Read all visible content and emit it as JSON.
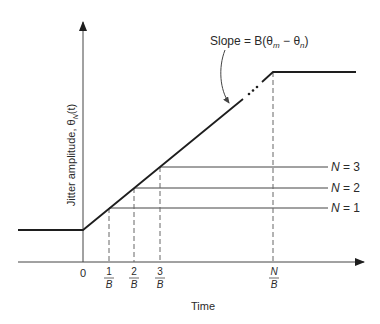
{
  "figure": {
    "y_axis_label": "Jitter amplitude, θ",
    "y_axis_label_sub": "N",
    "y_axis_label_tail": "(t)",
    "x_axis_label": "Time",
    "slope_annotation": "Slope = B(θ",
    "slope_sub_m": "m",
    "slope_minus": " − θ",
    "slope_sub_n": "n",
    "slope_close": ")",
    "ellipsis": "...",
    "x_ticks": [
      {
        "label": "0",
        "numerator": "",
        "denominator": ""
      },
      {
        "label": "1/B",
        "numerator": "1",
        "denominator": "B"
      },
      {
        "label": "2/B",
        "numerator": "2",
        "denominator": "B"
      },
      {
        "label": "3/B",
        "numerator": "3",
        "denominator": "B"
      },
      {
        "label": "N/B",
        "numerator": "N",
        "denominator": "B"
      }
    ],
    "levels": [
      {
        "label": "N = 1",
        "var": "N",
        "eq": " = 1"
      },
      {
        "label": "N = 2",
        "var": "N",
        "eq": " = 2"
      },
      {
        "label": "N = 3",
        "var": "N",
        "eq": " = 3"
      }
    ],
    "colors": {
      "line": "#1e1e1e",
      "thin": "#444444",
      "dash": "#666666"
    }
  }
}
